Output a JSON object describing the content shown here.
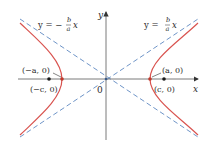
{
  "diagram": {
    "colors": {
      "axis": "#6b6b6b",
      "hyperbola": "#d9534f",
      "asymptote": "#6f95c8",
      "point": "#1a1a1a",
      "vertex": "#c0392b",
      "text": "#2a2a2a"
    },
    "axes": {
      "x_label": "x",
      "y_label": "y",
      "origin_label": "0"
    },
    "asymptotes": [
      {
        "label_prefix": "y = −",
        "numerator": "b",
        "denominator": "a",
        "suffix": "x",
        "slope_sign": "negative"
      },
      {
        "label_prefix": "y = ",
        "numerator": "b",
        "denominator": "a",
        "suffix": "x",
        "slope_sign": "positive"
      }
    ],
    "points": {
      "left_vertex": "(−a, 0)",
      "right_vertex": "(a, 0)",
      "left_focus": "(−c, 0)",
      "right_focus": "(c, 0)"
    }
  }
}
